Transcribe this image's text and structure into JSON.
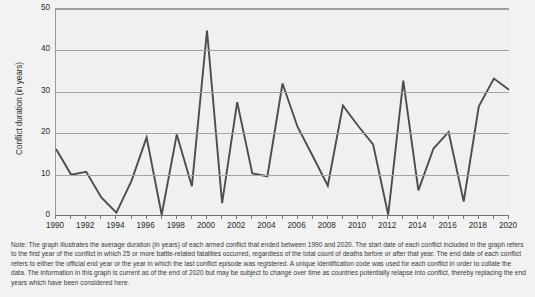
{
  "chart_data": {
    "type": "line",
    "title": "",
    "xlabel": "",
    "ylabel": "Conflict duration (in years)",
    "xlim": [
      1990,
      2020
    ],
    "ylim": [
      0,
      50
    ],
    "ytick_labels": [
      "0",
      "10",
      "20",
      "30",
      "40",
      "50"
    ],
    "yticks": [
      0,
      10,
      20,
      30,
      40,
      50
    ],
    "xtick_labels": [
      "1990",
      "1992",
      "1994",
      "1996",
      "1998",
      "2000",
      "2002",
      "2004",
      "2006",
      "2008",
      "2010",
      "2012",
      "2014",
      "2016",
      "2018",
      "2020"
    ],
    "xticks": [
      1990,
      1992,
      1994,
      1996,
      1998,
      2000,
      2002,
      2004,
      2006,
      2008,
      2010,
      2012,
      2014,
      2016,
      2018,
      2020
    ],
    "grid": "horizontal",
    "legend": "none",
    "line_color": "#4d4d4d",
    "plot_background": "#f0f0f0",
    "x": [
      1990,
      1991,
      1992,
      1993,
      1994,
      1995,
      1996,
      1997,
      1998,
      1999,
      2000,
      2001,
      2002,
      2003,
      2004,
      2005,
      2006,
      2007,
      2008,
      2009,
      2010,
      2011,
      2012,
      2013,
      2014,
      2015,
      2016,
      2017,
      2018,
      2019,
      2020
    ],
    "values": [
      16.2,
      10.0,
      10.7,
      4.5,
      0.8,
      8.5,
      19.0,
      0.3,
      19.7,
      7.2,
      44.8,
      3.1,
      27.5,
      10.3,
      9.6,
      32.0,
      21.5,
      14.5,
      7.3,
      26.7,
      21.8,
      17.3,
      0.3,
      32.7,
      6.2,
      16.3,
      20.3,
      3.5,
      26.5,
      33.2,
      30.5
    ],
    "series_name": "Average conflict duration"
  },
  "note": {
    "text": "Note: The graph illustrates the average duration (in years) of each armed conflict that ended between 1990 and 2020. The start date of each conflict included in the graph refers to the first year of the conflict in which 25 or more battle-related fatalities occurred, regardless of the total count of deaths before or after that year. The end date of each conflict refers to either the official end year or the year in which the last conflict episode was registered. A unique identification code was used for each conflict in order to collate the data. The information in this graph is current as of the end of 2020 but may be subject to change over time as countries potentially relapse into conflict, thereby replacing the end years which have been considered here."
  }
}
